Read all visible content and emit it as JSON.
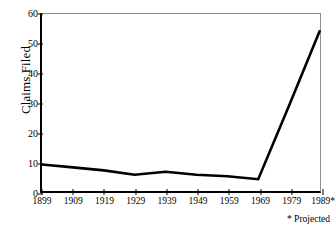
{
  "chart_data": {
    "type": "line",
    "title": "",
    "xlabel": "",
    "ylabel": "Claims Filed",
    "x": [
      "1899",
      "1909",
      "1919",
      "1929",
      "1939",
      "1949",
      "1959",
      "1969",
      "1979",
      "1989*"
    ],
    "categories": [
      "1899",
      "1909",
      "1919",
      "1929",
      "1939",
      "1949",
      "1959",
      "1969",
      "1979",
      "1989*"
    ],
    "values": [
      9,
      8,
      7,
      5.5,
      6.5,
      5.5,
      5,
      4,
      29,
      54.5
    ],
    "series": [
      {
        "name": "Claims Filed",
        "values": [
          9,
          8,
          7,
          5.5,
          6.5,
          5.5,
          5,
          4,
          29,
          54.5
        ]
      }
    ],
    "ylim": [
      0,
      60
    ],
    "yticks": [
      0,
      10,
      20,
      30,
      40,
      50,
      60
    ],
    "ytick_labels": [
      "0",
      "10",
      "20",
      "30",
      "40",
      "50",
      "60"
    ],
    "xtick_labels": [
      "1899",
      "1909",
      "1919",
      "1929",
      "1939",
      "1949",
      "1959",
      "1969",
      "1979",
      "1989*"
    ],
    "grid": false,
    "legend": false,
    "legend_position": "none",
    "annotations": [
      "* Projected"
    ],
    "line_color": "#000000",
    "frame_color": "#8f8f8f",
    "axis_color": "#000000"
  },
  "footnote": {
    "text": "* Projected"
  }
}
